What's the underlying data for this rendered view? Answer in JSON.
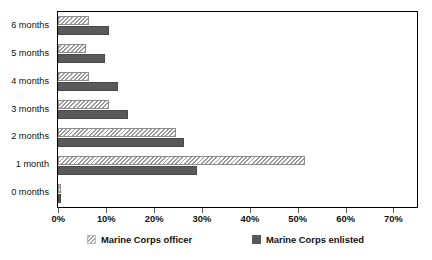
{
  "chart_data": {
    "type": "bar",
    "orientation": "horizontal",
    "title": "",
    "subtitle": "",
    "xlabel": "",
    "ylabel": "",
    "xlim": [
      0,
      75
    ],
    "ylim": null,
    "grid": false,
    "legend_position": "bottom",
    "categories": [
      "0 months",
      "1 month",
      "2 months",
      "3 months",
      "4 months",
      "5 months",
      "6 months"
    ],
    "xticks": [
      0,
      10,
      20,
      30,
      40,
      50,
      60,
      70
    ],
    "xtick_labels": [
      "0%",
      "10%",
      "20%",
      "30%",
      "40%",
      "50%",
      "60%",
      "70%"
    ],
    "series": [
      {
        "name": "Marine Corps officer",
        "style": "hatched",
        "color": "#9b9b9b",
        "values": [
          0.5,
          51.5,
          24.5,
          10.5,
          6.3,
          5.8,
          6.4
        ]
      },
      {
        "name": "Marine Corps enlisted",
        "style": "solid",
        "color": "#595959",
        "values": [
          0.5,
          29.0,
          26.2,
          14.5,
          12.4,
          9.8,
          10.5
        ]
      }
    ],
    "legend": [
      "Marine Corps officer",
      "Marine Corps enlisted"
    ]
  },
  "legend": {
    "entries": [
      {
        "label": "Marine Corps officer",
        "swatch": "hatched-swatch"
      },
      {
        "label": "Marine Corps enlisted",
        "swatch": "solid-swatch"
      }
    ]
  },
  "colors": {
    "officer": "#9b9b9b",
    "enlisted": "#595959",
    "axis": "#000000",
    "background": "#ffffff",
    "text": "#111111"
  }
}
